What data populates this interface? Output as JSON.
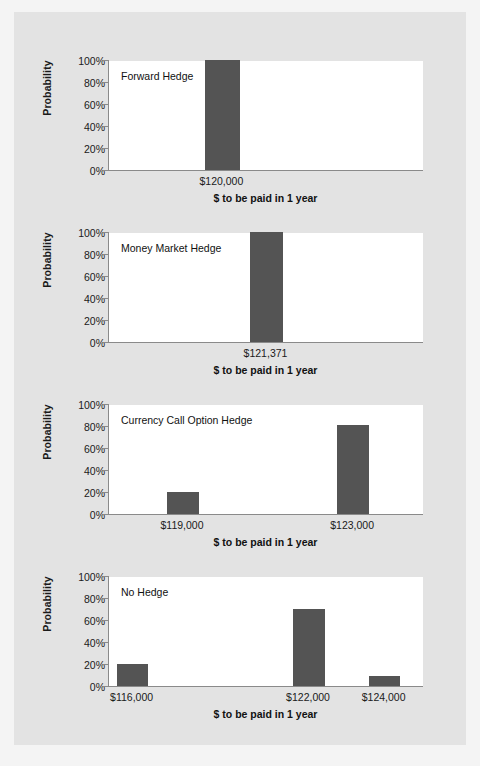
{
  "figure": {
    "background_color": "#f4f4f4",
    "panel_color": "#e3e3e3",
    "plot_color": "#ffffff",
    "bar_color": "#545454",
    "axis_color": "#8a8a8a"
  },
  "chart_data": [
    {
      "type": "bar",
      "title": "Forward Hedge",
      "xlabel": "$ to be paid in 1 year",
      "ylabel": "Probability",
      "categories": [
        "$120,000"
      ],
      "values": [
        100
      ],
      "category_positions": [
        0.36
      ],
      "bar_width": 0.11,
      "ylim": [
        0,
        100
      ],
      "yticks": [
        0,
        20,
        40,
        60,
        80,
        100
      ],
      "ytick_labels": [
        "0%",
        "20%",
        "40%",
        "60%",
        "80%",
        "100%"
      ],
      "grid": false,
      "legend": "none"
    },
    {
      "type": "bar",
      "title": "Money Market Hedge",
      "xlabel": "$ to be paid in 1 year",
      "ylabel": "Probability",
      "categories": [
        "$121,371"
      ],
      "values": [
        100
      ],
      "category_positions": [
        0.5
      ],
      "bar_width": 0.105,
      "ylim": [
        0,
        100
      ],
      "yticks": [
        0,
        20,
        40,
        60,
        80,
        100
      ],
      "ytick_labels": [
        "0%",
        "20%",
        "40%",
        "60%",
        "80%",
        "100%"
      ],
      "grid": false,
      "legend": "none"
    },
    {
      "type": "bar",
      "title": "Currency Call Option Hedge",
      "xlabel": "$ to be paid in 1 year",
      "ylabel": "Probability",
      "categories": [
        "$119,000",
        "$123,000"
      ],
      "values": [
        20,
        81
      ],
      "category_positions": [
        0.235,
        0.775
      ],
      "bar_width": 0.1,
      "ylim": [
        0,
        100
      ],
      "yticks": [
        0,
        20,
        40,
        60,
        80,
        100
      ],
      "ytick_labels": [
        "0%",
        "20%",
        "40%",
        "60%",
        "80%",
        "100%"
      ],
      "grid": false,
      "legend": "none"
    },
    {
      "type": "bar",
      "title": "No Hedge",
      "xlabel": "$ to be paid in 1 year",
      "ylabel": "Probability",
      "categories": [
        "$116,000",
        "$122,000",
        "$124,000"
      ],
      "values": [
        20,
        70,
        9
      ],
      "category_positions": [
        0.075,
        0.635,
        0.875
      ],
      "bar_width": 0.1,
      "ylim": [
        0,
        100
      ],
      "yticks": [
        0,
        20,
        40,
        60,
        80,
        100
      ],
      "ytick_labels": [
        "0%",
        "20%",
        "40%",
        "60%",
        "80%",
        "100%"
      ],
      "grid": false,
      "legend": "none"
    }
  ]
}
